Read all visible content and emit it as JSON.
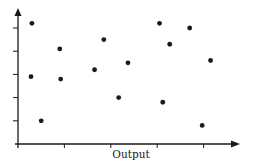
{
  "chart_data": {
    "type": "scatter",
    "title": "",
    "xlabel": "Output",
    "ylabel": "",
    "grid": false,
    "legend": null,
    "x_ticks": 4,
    "y_ticks": 5,
    "x_tick_labels": [],
    "y_tick_labels": [],
    "xlim": [
      0,
      5
    ],
    "ylim": [
      0,
      5.5
    ],
    "points": [
      {
        "x": 0.3,
        "y": 5.2
      },
      {
        "x": 0.28,
        "y": 2.9
      },
      {
        "x": 0.5,
        "y": 1.0
      },
      {
        "x": 0.9,
        "y": 4.1
      },
      {
        "x": 0.92,
        "y": 2.8
      },
      {
        "x": 1.65,
        "y": 3.2
      },
      {
        "x": 1.85,
        "y": 4.5
      },
      {
        "x": 2.17,
        "y": 2.0
      },
      {
        "x": 2.37,
        "y": 3.5
      },
      {
        "x": 3.05,
        "y": 5.2
      },
      {
        "x": 3.27,
        "y": 4.3
      },
      {
        "x": 3.7,
        "y": 5.0
      },
      {
        "x": 3.12,
        "y": 1.8
      },
      {
        "x": 4.15,
        "y": 3.6
      },
      {
        "x": 3.97,
        "y": 0.8
      }
    ]
  },
  "colors": {
    "axis": "#1a1a1a",
    "point": "#1a1a1a",
    "background": "#ffffff"
  }
}
